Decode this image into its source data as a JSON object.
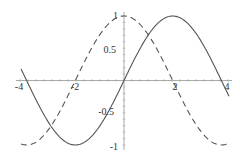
{
  "chart_data": {
    "type": "line",
    "title": "",
    "xlabel": "",
    "ylabel": "",
    "xlim": [
      -4.2,
      4.2
    ],
    "ylim": [
      -1,
      1
    ],
    "grid": false,
    "legend": null,
    "x_ticks": [
      {
        "label": "-4",
        "px": 19,
        "py": 90
      },
      {
        "label": "-2",
        "px": 75,
        "py": 90
      },
      {
        "label": "2",
        "px": 175,
        "py": 90
      },
      {
        "label": "4",
        "px": 227,
        "py": 90
      }
    ],
    "y_ticks": [
      {
        "label": "1",
        "px": 118,
        "py": 19
      },
      {
        "label": "0.5",
        "px": 116,
        "py": 53
      },
      {
        "label": "-0.5",
        "px": 114,
        "py": 115
      },
      {
        "label": "-1",
        "px": 118,
        "py": 150
      }
    ],
    "series": [
      {
        "name": "sin(x)",
        "style": "solid",
        "color": "#555555",
        "x": [
          -4.2,
          -3.14,
          -1.57,
          0,
          1.57,
          3.14,
          4.2
        ],
        "values": [
          0.87,
          0,
          -1,
          0,
          1,
          0,
          -0.87
        ]
      },
      {
        "name": "cos(x)",
        "style": "dashed",
        "color": "#555555",
        "x": [
          -4.2,
          -3.14,
          -1.57,
          0,
          1.57,
          3.14,
          4.2
        ],
        "values": [
          -0.49,
          -1,
          0,
          1,
          0,
          -1,
          -0.49
        ]
      }
    ]
  },
  "plot": {
    "origin_px": [
      124,
      80.5
    ],
    "x_scale_px_per_unit": 31,
    "y_scale_px_per_unit": 64.5,
    "x_start_px": 21,
    "x_end_px": 229,
    "axis_color": "#aaaaaa",
    "curve_color": "#555555"
  }
}
